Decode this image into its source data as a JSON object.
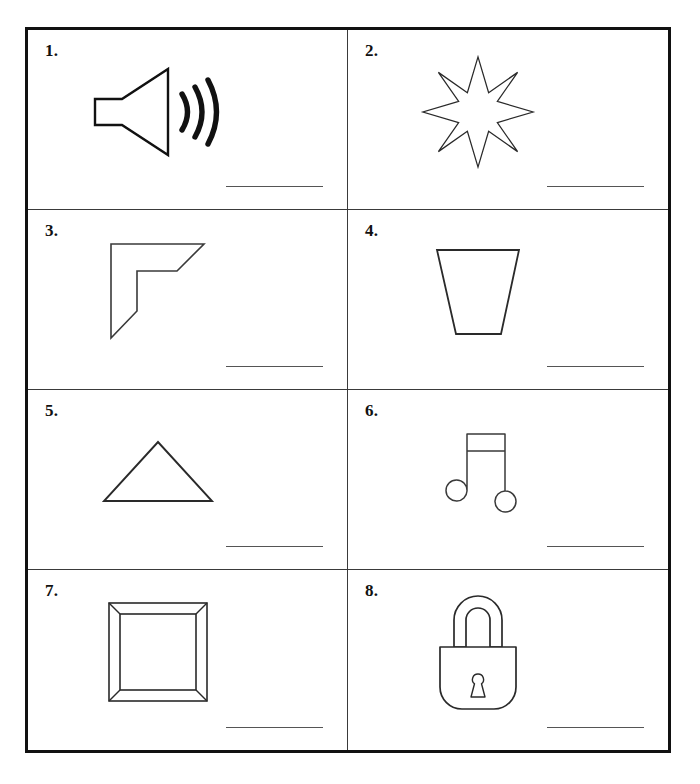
{
  "worksheet": {
    "type": "picture-naming-worksheet",
    "layout": {
      "columns": 2,
      "rows": 4,
      "total_items": 8
    },
    "ink_color": "#111111",
    "line_color": "#555555",
    "border_color": "#111111",
    "grid_line_color": "#3a3a3a",
    "background_color": "#ffffff",
    "items": [
      {
        "number": "1.",
        "icon": "speaker-sound-icon",
        "description": "Loudspeaker with three sound waves",
        "answer_value": ""
      },
      {
        "number": "2.",
        "icon": "eight-pointed-star-icon",
        "description": "Eight pointed star outline",
        "answer_value": ""
      },
      {
        "number": "3.",
        "icon": "corner-bracket-icon",
        "description": "Angular L shaped corner bracket",
        "answer_value": ""
      },
      {
        "number": "4.",
        "icon": "trapezoid-cup-icon",
        "description": "Inverted trapezoid cup shape",
        "answer_value": ""
      },
      {
        "number": "5.",
        "icon": "triangle-icon",
        "description": "Isosceles triangle outline",
        "answer_value": ""
      },
      {
        "number": "6.",
        "icon": "music-note-icon",
        "description": "Beamed pair of eighth notes",
        "answer_value": ""
      },
      {
        "number": "7.",
        "icon": "picture-frame-icon",
        "description": "Square picture frame with mitered corners",
        "answer_value": ""
      },
      {
        "number": "8.",
        "icon": "padlock-icon",
        "description": "Closed padlock with keyhole",
        "answer_value": ""
      }
    ]
  }
}
